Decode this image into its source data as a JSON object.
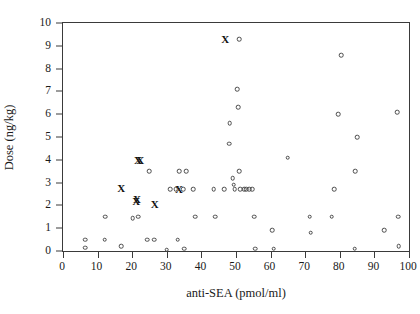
{
  "chart_data": {
    "type": "scatter",
    "title": "",
    "xlabel": "anti-SEA (pmol/ml)",
    "ylabel": "Dose (ng/kg)",
    "xlim": [
      0,
      100
    ],
    "ylim": [
      0,
      10
    ],
    "xticks": [
      0,
      10,
      20,
      30,
      40,
      50,
      60,
      70,
      80,
      90,
      100
    ],
    "yticks": [
      0,
      1,
      2,
      3,
      4,
      5,
      6,
      7,
      8,
      9,
      10
    ],
    "xtick_labels": [
      "0",
      "10",
      "20",
      "30",
      "40",
      "50",
      "60",
      "70",
      "80",
      "90",
      "100"
    ],
    "ytick_labels": [
      "0",
      "1",
      "2",
      "3",
      "4",
      "5",
      "6",
      "7",
      "8",
      "9",
      "10"
    ],
    "grid": false,
    "legend": null,
    "series": [
      {
        "name": "open-circle",
        "marker": "circle",
        "points": [
          [
            6.4,
            0.5
          ],
          [
            6.4,
            0.15
          ],
          [
            12.0,
            0.5
          ],
          [
            12.2,
            1.5
          ],
          [
            16.8,
            0.2
          ],
          [
            20.2,
            1.45
          ],
          [
            21.8,
            1.5
          ],
          [
            24.3,
            0.5
          ],
          [
            24.9,
            3.5
          ],
          [
            26.4,
            0.5
          ],
          [
            30.0,
            0.05
          ],
          [
            30.9,
            2.7
          ],
          [
            32.6,
            2.7
          ],
          [
            33.2,
            0.5
          ],
          [
            33.6,
            3.5
          ],
          [
            34.7,
            2.7
          ],
          [
            35.1,
            0.1
          ],
          [
            35.6,
            3.5
          ],
          [
            37.6,
            2.7
          ],
          [
            38.2,
            1.5
          ],
          [
            43.6,
            2.7
          ],
          [
            44.0,
            1.5
          ],
          [
            46.6,
            2.7
          ],
          [
            48.0,
            4.7
          ],
          [
            48.2,
            5.6
          ],
          [
            49.0,
            3.2
          ],
          [
            49.3,
            2.9
          ],
          [
            49.6,
            2.7
          ],
          [
            50.9,
            9.3
          ],
          [
            50.6,
            6.3
          ],
          [
            50.3,
            7.1
          ],
          [
            51.0,
            3.5
          ],
          [
            51.3,
            2.7
          ],
          [
            52.4,
            2.7
          ],
          [
            53.0,
            2.7
          ],
          [
            53.8,
            2.7
          ],
          [
            54.6,
            2.7
          ],
          [
            55.2,
            1.5
          ],
          [
            55.6,
            0.1
          ],
          [
            60.4,
            0.9
          ],
          [
            60.9,
            0.1
          ],
          [
            64.9,
            4.1
          ],
          [
            71.3,
            1.5
          ],
          [
            71.6,
            0.8
          ],
          [
            77.7,
            1.5
          ],
          [
            78.3,
            2.7
          ],
          [
            79.6,
            6.0
          ],
          [
            80.4,
            8.6
          ],
          [
            84.5,
            3.5
          ],
          [
            84.3,
            0.1
          ],
          [
            85.0,
            5.0
          ],
          [
            92.8,
            0.9
          ],
          [
            96.6,
            6.1
          ],
          [
            96.8,
            1.5
          ],
          [
            97.0,
            0.2
          ]
        ]
      },
      {
        "name": "x-cross",
        "marker": "x",
        "points": [
          [
            16.8,
            2.75
          ],
          [
            21.2,
            2.2
          ],
          [
            21.4,
            2.3
          ],
          [
            21.7,
            4.0
          ],
          [
            22.3,
            4.0
          ],
          [
            26.5,
            2.05
          ],
          [
            33.5,
            2.7
          ],
          [
            46.9,
            9.3
          ]
        ]
      }
    ]
  }
}
